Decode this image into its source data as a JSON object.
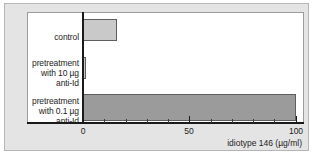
{
  "chart_data": {
    "type": "bar",
    "orientation": "horizontal",
    "title": "",
    "xlabel": "idiotype 146 (µg/ml)",
    "ylabel": "",
    "xlim": [
      0,
      103
    ],
    "xticks": [
      0,
      50,
      100
    ],
    "xtick_labels": [
      "0",
      "50",
      "100"
    ],
    "minor_tick_step": 10,
    "grid": false,
    "legend": null,
    "categories": [
      "control",
      "pretreatment with 10 µg anti-Id",
      "pretreatment with 0.1 µg anti-Id"
    ],
    "category_label_lines": [
      [
        "control"
      ],
      [
        "pretreatment",
        "with 10 µg",
        "anti-Id"
      ],
      [
        "pretreatment",
        "with 0.1 µg",
        "anti-Id"
      ]
    ],
    "values": [
      16,
      1.5,
      100
    ],
    "bar_colors": [
      "#c9c9c9",
      "#c9c9c9",
      "#9b9b9b"
    ],
    "bar_edge_color": "#5e5e5e",
    "plot_background": "#ffffff",
    "figure_background": "#e4e4e4",
    "axis_color": "#1a1a1a"
  }
}
